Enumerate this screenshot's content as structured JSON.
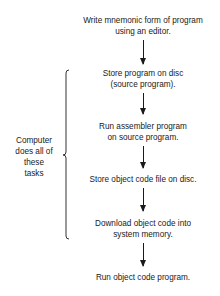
{
  "diagram": {
    "type": "flowchart",
    "steps": [
      {
        "line1": "Write mnemonic form of program",
        "line2": "using an editor."
      },
      {
        "line1": "Store program on disc",
        "line2": "(source program)."
      },
      {
        "line1": "Run assembler program",
        "line2": "on source program."
      },
      {
        "line1": "Store object code file on disc.",
        "line2": ""
      },
      {
        "line1": "Download object code into",
        "line2": "system memory."
      },
      {
        "line1": "Run object code program.",
        "line2": ""
      }
    ],
    "brace_label": {
      "line1": "Computer",
      "line2": "does all of",
      "line3": "these",
      "line4": "tasks"
    }
  }
}
